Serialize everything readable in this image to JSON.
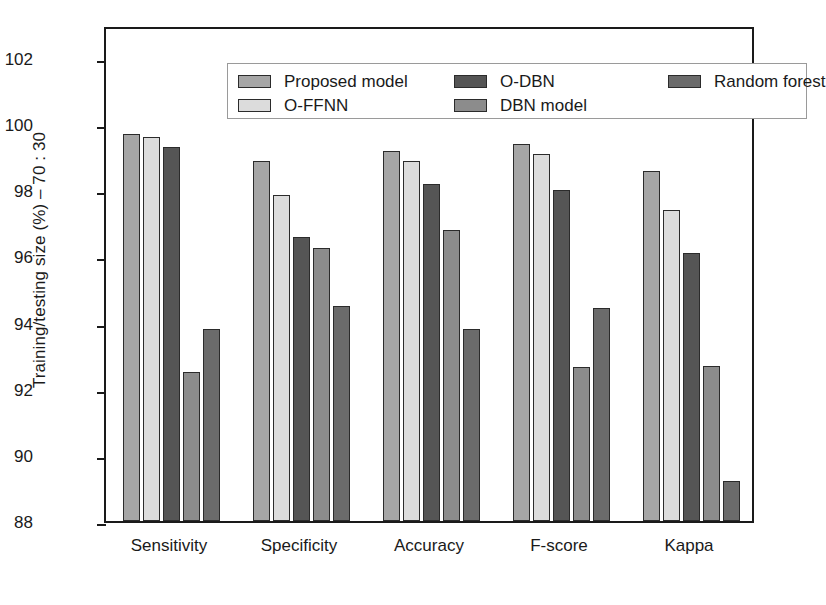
{
  "chart_data": {
    "type": "bar",
    "title": "",
    "xlabel": "",
    "ylabel": "Training/testing size (%) – 70 : 30",
    "ylim": [
      88,
      103
    ],
    "yticks": [
      88,
      90,
      92,
      94,
      96,
      98,
      100,
      102
    ],
    "ytick_labels": [
      "88",
      "90",
      "92",
      "94",
      "96",
      "98",
      "100",
      "102"
    ],
    "grid": false,
    "legend_position": "top-inside",
    "categories": [
      "Sensitivity",
      "Specificity",
      "Accuracy",
      "F-score",
      "Kappa"
    ],
    "series": [
      {
        "name": "Proposed model",
        "color": "#a6a6a6",
        "values": [
          99.7,
          98.9,
          99.2,
          99.4,
          98.6
        ]
      },
      {
        "name": "O-FFNN",
        "color": "#dcdcdc",
        "values": [
          99.6,
          97.85,
          98.9,
          99.1,
          97.4
        ]
      },
      {
        "name": "O-DBN",
        "color": "#555555",
        "values": [
          99.3,
          96.6,
          98.2,
          98.0,
          96.1
        ]
      },
      {
        "name": "DBN model",
        "color": "#8c8c8c",
        "values": [
          92.5,
          96.25,
          96.8,
          92.65,
          92.7
        ]
      },
      {
        "name": "Random forest",
        "color": "#6b6b6b",
        "values": [
          93.8,
          94.5,
          93.8,
          94.45,
          89.2
        ]
      }
    ]
  },
  "legend": {
    "columns": [
      [
        "Proposed model",
        "O-FFNN"
      ],
      [
        "O-DBN",
        "DBN model"
      ],
      [
        "Random forest"
      ]
    ]
  },
  "colors": {
    "axis": "#1a1a1a",
    "frame": "#1a1a1a",
    "background": "#ffffff",
    "legend_border": "#9a9a9a",
    "bar_outline": "#2b2b2b"
  }
}
